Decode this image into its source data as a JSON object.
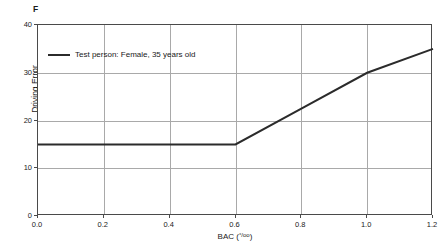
{
  "panel": {
    "marker": "F"
  },
  "chart_data": {
    "type": "line",
    "title": "",
    "subtitle": "",
    "xlabel": "BAC (°/oo)",
    "xlabel_base": "BAC (",
    "xlabel_permille": "°/oo",
    "xlabel_close": ")",
    "ylabel": "Driving Error",
    "xlim": [
      0.0,
      1.2
    ],
    "ylim": [
      0,
      40
    ],
    "xticks": [
      "0.0",
      "0.2",
      "0.4",
      "0.6",
      "0.8",
      "1.0",
      "1.2"
    ],
    "xtick_values": [
      0.0,
      0.2,
      0.4,
      0.6,
      0.8,
      1.0,
      1.2
    ],
    "yticks": [
      "0",
      "10",
      "20",
      "30",
      "40"
    ],
    "ytick_values": [
      0,
      10,
      20,
      30,
      40
    ],
    "grid": true,
    "grid_color": "#a9a9a9",
    "legend_position": "upper-left-inside",
    "series": [
      {
        "name": "Test person: Female, 35 years old",
        "color": "#2b2b2b",
        "x": [
          0.0,
          0.2,
          0.4,
          0.6,
          0.8,
          1.0,
          1.2
        ],
        "values": [
          15,
          15,
          15,
          15,
          22.5,
          30,
          35
        ]
      }
    ],
    "annotations": [
      "F"
    ]
  },
  "legend": {
    "entries": [
      {
        "label": "Test person: Female, 35 years old",
        "color": "#2b2b2b"
      }
    ]
  },
  "colors": {
    "axis": "#4a4a4a",
    "grid": "#a9a9a9",
    "series": "#2b2b2b",
    "text": "#1a1a1a",
    "background": "#ffffff"
  }
}
